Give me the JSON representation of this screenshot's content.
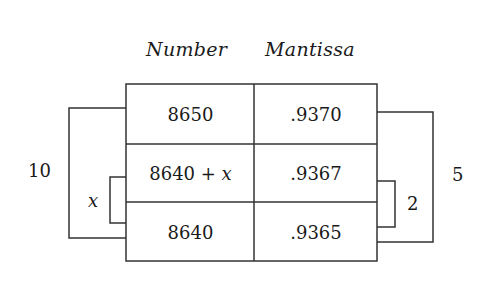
{
  "headers": {
    "number": "Number",
    "mantissa": "Mantissa"
  },
  "rows": [
    {
      "number": "8650",
      "mantissa": ".9370"
    },
    {
      "number": "8640 + x",
      "mantissa": ".9367"
    },
    {
      "number": "8640",
      "mantissa": ".9365"
    }
  ],
  "brackets": {
    "left_outer": "10",
    "left_inner": "x",
    "right_inner": "2",
    "right_outer": "5"
  },
  "colors": {
    "line": "#333333",
    "text": "#1a1a1a",
    "background": "#ffffff"
  }
}
